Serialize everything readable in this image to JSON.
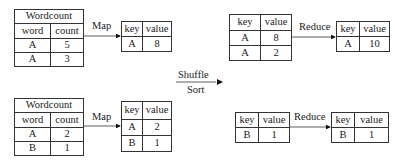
{
  "mapper1": {
    "input": {
      "title": "Wordcount",
      "headers": [
        "word",
        "count"
      ],
      "rows": [
        [
          "A",
          "5"
        ],
        [
          "A",
          "3"
        ]
      ]
    },
    "map_label": "Map",
    "output": {
      "headers": [
        "key",
        "value"
      ],
      "rows": [
        [
          "A",
          "8"
        ]
      ]
    }
  },
  "mapper2": {
    "input": {
      "title": "Wordcount",
      "headers": [
        "word",
        "count"
      ],
      "rows": [
        [
          "A",
          "2"
        ],
        [
          "B",
          "1"
        ]
      ]
    },
    "map_label": "Map",
    "output": {
      "headers": [
        "key",
        "value"
      ],
      "rows": [
        [
          "A",
          "2"
        ],
        [
          "B",
          "1"
        ]
      ]
    }
  },
  "shuffle": {
    "top_label": "Shuffle",
    "bottom_label": "Sort"
  },
  "reducer1": {
    "input": {
      "headers": [
        "key",
        "value"
      ],
      "rows": [
        [
          "A",
          "8"
        ],
        [
          "A",
          "2"
        ]
      ]
    },
    "reduce_label": "Reduce",
    "output": {
      "headers": [
        "key",
        "value"
      ],
      "rows": [
        [
          "A",
          "10"
        ]
      ]
    }
  },
  "reducer2": {
    "input": {
      "headers": [
        "key",
        "value"
      ],
      "rows": [
        [
          "B",
          "1"
        ]
      ]
    },
    "reduce_label": "Reduce",
    "output": {
      "headers": [
        "key",
        "value"
      ],
      "rows": [
        [
          "B",
          "1"
        ]
      ]
    }
  }
}
